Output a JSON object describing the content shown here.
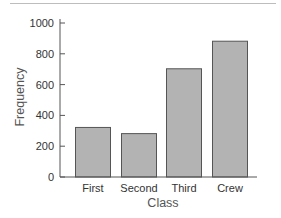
{
  "chart_data": {
    "type": "bar",
    "title": "",
    "xlabel": "Class",
    "ylabel": "Frequency",
    "categories": [
      "First",
      "Second",
      "Third",
      "Crew"
    ],
    "values": [
      325,
      285,
      706,
      885
    ],
    "ylim": [
      0,
      1000
    ],
    "yticks": [
      0,
      200,
      400,
      600,
      800,
      1000
    ],
    "grid": false,
    "legend": null,
    "colors": {
      "bar_fill": "#b3b3b3",
      "bar_stroke": "#555555",
      "axis": "#555555"
    }
  }
}
